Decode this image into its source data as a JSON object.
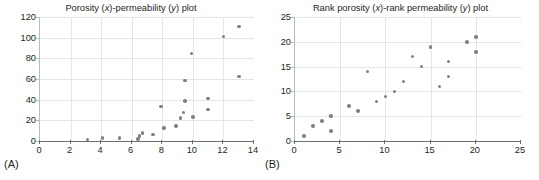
{
  "figure": {
    "panel_a_label": "(A)",
    "panel_b_label": "(B)",
    "marker_color": "#7f8183",
    "grid_color": "#e3e5e6",
    "axis_color": "#6d6e71",
    "text_color": "#231f20"
  },
  "chart_data": [
    {
      "type": "scatter",
      "panel": "A",
      "title": "Porosity (x)-permeability (y) plot",
      "title_parts": [
        "Porosity (",
        "x",
        ")-permeability (",
        "y",
        ") plot"
      ],
      "xlabel": "",
      "ylabel": "",
      "xlim": [
        0,
        14
      ],
      "ylim": [
        0,
        120
      ],
      "xticks": [
        0,
        2,
        4,
        6,
        8,
        10,
        12,
        14
      ],
      "yticks": [
        0,
        20,
        40,
        60,
        80,
        100,
        120
      ],
      "grid": true,
      "legend": "none",
      "points": [
        {
          "x": 3.1,
          "y": 1.3
        },
        {
          "x": 4.1,
          "y": 2.8
        },
        {
          "x": 5.2,
          "y": 3.0
        },
        {
          "x": 6.4,
          "y": 2.0
        },
        {
          "x": 6.5,
          "y": 4.4
        },
        {
          "x": 6.5,
          "y": 5.4
        },
        {
          "x": 6.7,
          "y": 7.5
        },
        {
          "x": 7.4,
          "y": 6.4
        },
        {
          "x": 7.9,
          "y": 33.5
        },
        {
          "x": 8.1,
          "y": 12.5
        },
        {
          "x": 8.9,
          "y": 14.8
        },
        {
          "x": 9.2,
          "y": 22.0
        },
        {
          "x": 9.4,
          "y": 27.5
        },
        {
          "x": 9.5,
          "y": 38.5
        },
        {
          "x": 9.5,
          "y": 58.5
        },
        {
          "x": 9.9,
          "y": 84.5
        },
        {
          "x": 10.0,
          "y": 23.5
        },
        {
          "x": 11.0,
          "y": 30.5
        },
        {
          "x": 11.0,
          "y": 41.0
        },
        {
          "x": 12.0,
          "y": 101.0
        },
        {
          "x": 13.0,
          "y": 62.5
        },
        {
          "x": 13.0,
          "y": 111.0
        }
      ]
    },
    {
      "type": "scatter",
      "panel": "B",
      "title": "Rank porosity (x)-rank permeability (y) plot",
      "title_parts": [
        "Rank porosity (",
        "x",
        ")-rank permeability (",
        "y",
        ") plot"
      ],
      "xlabel": "",
      "ylabel": "",
      "xlim": [
        0,
        25
      ],
      "ylim": [
        0,
        25
      ],
      "xticks": [
        0,
        5,
        10,
        15,
        20,
        25
      ],
      "yticks": [
        0,
        5,
        10,
        15,
        20,
        25
      ],
      "grid": true,
      "legend": "none",
      "points": [
        {
          "x": 1,
          "y": 1
        },
        {
          "x": 2,
          "y": 3
        },
        {
          "x": 3,
          "y": 4
        },
        {
          "x": 4,
          "y": 5
        },
        {
          "x": 4,
          "y": 2
        },
        {
          "x": 6,
          "y": 7
        },
        {
          "x": 7,
          "y": 6
        },
        {
          "x": 8,
          "y": 14
        },
        {
          "x": 9,
          "y": 8
        },
        {
          "x": 10,
          "y": 9
        },
        {
          "x": 11,
          "y": 10
        },
        {
          "x": 12,
          "y": 12
        },
        {
          "x": 13,
          "y": 17
        },
        {
          "x": 14,
          "y": 15
        },
        {
          "x": 15,
          "y": 19
        },
        {
          "x": 16,
          "y": 11
        },
        {
          "x": 17,
          "y": 16
        },
        {
          "x": 17,
          "y": 13
        },
        {
          "x": 19,
          "y": 20
        },
        {
          "x": 20,
          "y": 21
        },
        {
          "x": 20,
          "y": 18
        }
      ]
    }
  ]
}
